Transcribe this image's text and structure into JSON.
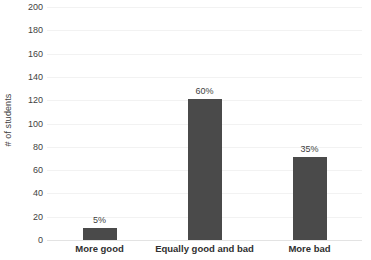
{
  "chart_data": {
    "type": "bar",
    "title": "",
    "xlabel": "",
    "ylabel": "# of students",
    "categories": [
      "More good",
      "Equally good and bad",
      "More bad"
    ],
    "values": [
      10,
      121,
      71
    ],
    "data_labels": [
      "5%",
      "60%",
      "35%"
    ],
    "ylim": [
      0,
      200
    ],
    "ytick_labels": [
      "200",
      "180",
      "160",
      "140",
      "120",
      "100",
      "80",
      "60",
      "40",
      "20",
      "0"
    ],
    "ytick_values": [
      200,
      180,
      160,
      140,
      120,
      100,
      80,
      60,
      40,
      20,
      0
    ],
    "grid": true,
    "legend": false,
    "series": [
      {
        "name": "# of students",
        "values": [
          10,
          121,
          71
        ],
        "color": "#4a4a4a"
      }
    ],
    "colors": {
      "bar": "#4a4a4a",
      "gridline": "#f2f2f2",
      "baseline": "#e3e3e3",
      "tick_text": "#3f3f3f",
      "category_text": "#303030",
      "background": "#ffffff"
    }
  }
}
